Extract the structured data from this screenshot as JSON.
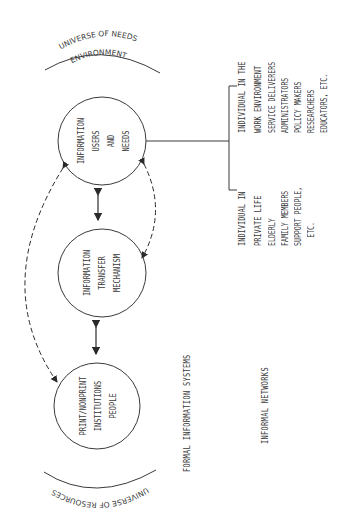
{
  "diagram": {
    "arcs": {
      "top": {
        "line1": "UNIVERSE OF NEEDS",
        "line2": "ENVIRONMENT"
      },
      "bottom": {
        "line1": "UNIVERSE OF RESOURCES"
      }
    },
    "nodes": [
      {
        "id": "users",
        "lines": [
          "INFORMATION",
          "USERS",
          "AND",
          "NEEDS"
        ]
      },
      {
        "id": "transfer",
        "lines": [
          "INFORMATION",
          "TRANSFER",
          "MECHANISM"
        ]
      },
      {
        "id": "resources",
        "lines": [
          "PRINT/NONPRINT",
          "INSTITUTIONS",
          "PEOPLE"
        ]
      }
    ],
    "edges": [
      {
        "from": "users",
        "to": "transfer",
        "style": "solid",
        "direction": "both"
      },
      {
        "from": "transfer",
        "to": "resources",
        "style": "solid",
        "direction": "both"
      },
      {
        "from": "users",
        "to": "transfer",
        "style": "dashed",
        "direction": "both",
        "side": "right"
      },
      {
        "from": "users",
        "to": "resources",
        "style": "dashed",
        "direction": "both",
        "side": "left"
      }
    ],
    "labels": {
      "formal": "FORMAL INFORMATION SYSTEMS",
      "informal": "INFORMAL NETWORKS"
    },
    "user_groups": {
      "private": {
        "heading": [
          "INDIVIDUAL IN",
          "PRIVATE LIFE"
        ],
        "items": [
          "ELDERLY",
          "FAMILY MEMBERS",
          "SUPPORT PEOPLE,",
          "ETC."
        ]
      },
      "work": {
        "heading": [
          "INDIVIDUAL IN THE",
          "WORK ENVIRONMENT"
        ],
        "items": [
          "SERVICE DELIVERERS",
          "ADMINISTRATORS",
          "POLICY MAKERS",
          "RESEARCHERS",
          "EDUCATORS, ETC."
        ]
      }
    },
    "colors": {
      "ink": "#3a3a3a",
      "background": "#ffffff"
    }
  }
}
